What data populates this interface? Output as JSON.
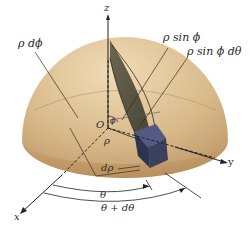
{
  "figure": {
    "axes": {
      "x": "x",
      "y": "y",
      "z": "z"
    },
    "labels": {
      "rho_dphi": "ρ dϕ",
      "rho_sinphi": "ρ sin ϕ",
      "rho_sinphi_dtheta": "ρ sin ϕ dθ",
      "origin": "O",
      "phi": "ϕ",
      "rho": "ρ",
      "drho": "dρ",
      "theta": "θ",
      "theta_plus_dtheta": "θ + dθ"
    },
    "colors": {
      "hemisphere_light": "#e6cfa5",
      "hemisphere_mid": "#c9a774",
      "hemisphere_dark": "#a8845a",
      "wedge": "#4b4a3a",
      "box": "#3b4060",
      "box_edge": "#5a6090",
      "axis": "#222222",
      "leader": "#3a2a1a"
    }
  }
}
